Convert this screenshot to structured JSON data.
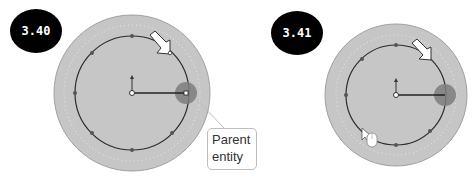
{
  "figures": [
    {
      "label": "3.40",
      "callout": {
        "line1": "Parent",
        "line2": "entity"
      }
    },
    {
      "label": "3.41"
    }
  ],
  "colors": {
    "badge": "#000000",
    "disc": "#c4c4c4",
    "disc_edge": "#9a9a9a",
    "circle": "#2a2a2a",
    "highlight": "#7a7a7a"
  }
}
